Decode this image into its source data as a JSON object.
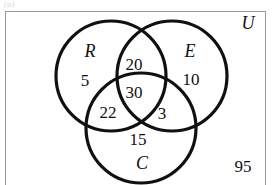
{
  "figure": {
    "type": "venn-diagram",
    "artifact_text": "(a)",
    "universe": {
      "label": "U",
      "outside_count": "95"
    },
    "sets": [
      {
        "key": "R",
        "label": "R",
        "only_count": "5"
      },
      {
        "key": "E",
        "label": "E",
        "only_count": "10"
      },
      {
        "key": "C",
        "label": "C",
        "only_count": "15"
      }
    ],
    "regions": {
      "r_only": "5",
      "e_only": "10",
      "c_only": "15",
      "r_and_e_only": "20",
      "r_and_c_only": "22",
      "e_and_c_only": "3",
      "r_and_e_and_c": "30",
      "outside_all": "95"
    },
    "colors": {
      "stroke": "#101010",
      "border": "#9a9a9a",
      "background": "#ffffff",
      "text": "#101010"
    }
  }
}
